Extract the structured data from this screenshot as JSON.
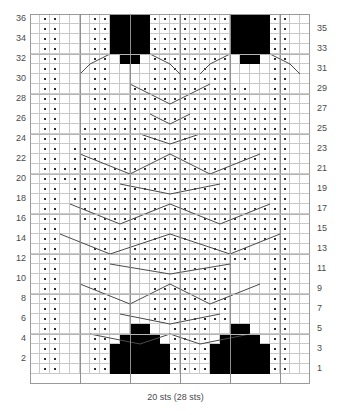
{
  "caption": "20 sts (28 sts)",
  "grid": {
    "columns": 28,
    "rows": 36,
    "cell_px": 10,
    "colors": {
      "knit_background": "#ffffff",
      "purl_dot": "#000000",
      "filled_block": "#000000",
      "grid_line": "#c9c9c9",
      "major_line": "#8f8f8f",
      "cable_line": "#4a4a4a",
      "label": "#4a4a4a"
    }
  },
  "row_labels": {
    "left": [
      36,
      34,
      32,
      30,
      28,
      26,
      24,
      22,
      20,
      18,
      16,
      14,
      12,
      10,
      8,
      6,
      4,
      2
    ],
    "right": [
      35,
      33,
      31,
      29,
      27,
      25,
      23,
      21,
      19,
      17,
      15,
      13,
      11,
      9,
      7,
      5,
      3,
      1
    ]
  },
  "chart_data": {
    "type": "heatmap",
    "title": "",
    "xlabel": "20 sts (28 sts)",
    "ylabel": "",
    "legend": [],
    "grid": true,
    "cols": 28,
    "rows": 36,
    "note": "Knitting cable chart. rows listed top (row 36) to bottom (row 1). Each row string has 28 chars: '.'=purl dot, 'K'=plain knit (empty cell), 'X'=solid black block.",
    "rows_top_to_bottom": [
      "K..KKK..XXXXXX..........XX..K",
      "K..KKK..XXXXXX..........XX..K",
      "K..KKK..XXXXXX..........XX..K",
      "K..KKK..XXXXXX..........XX..K"
    ],
    "cell_matrix_top_to_bottom": [
      [
        0,
        1,
        1,
        0,
        0,
        0,
        1,
        1,
        2,
        2,
        2,
        2,
        1,
        1,
        1,
        1,
        1,
        1,
        1,
        1,
        2,
        2,
        2,
        2,
        1,
        1,
        0,
        0
      ],
      [
        0,
        1,
        1,
        0,
        0,
        0,
        1,
        1,
        2,
        2,
        2,
        2,
        1,
        1,
        1,
        1,
        1,
        1,
        1,
        1,
        2,
        2,
        2,
        2,
        1,
        1,
        0,
        0
      ],
      [
        0,
        1,
        1,
        0,
        0,
        0,
        1,
        1,
        2,
        2,
        2,
        2,
        1,
        1,
        1,
        1,
        1,
        1,
        1,
        1,
        2,
        2,
        2,
        2,
        1,
        1,
        0,
        0
      ],
      [
        0,
        1,
        1,
        0,
        0,
        0,
        1,
        1,
        2,
        2,
        2,
        2,
        1,
        1,
        1,
        1,
        1,
        1,
        1,
        1,
        2,
        2,
        2,
        2,
        1,
        1,
        0,
        0
      ],
      [
        0,
        1,
        1,
        0,
        0,
        0,
        1,
        1,
        0,
        2,
        2,
        0,
        1,
        1,
        1,
        1,
        1,
        1,
        1,
        1,
        0,
        2,
        2,
        0,
        1,
        1,
        0,
        0
      ],
      [
        0,
        1,
        1,
        0,
        0,
        0,
        1,
        1,
        0,
        0,
        0,
        0,
        1,
        1,
        1,
        1,
        1,
        1,
        1,
        1,
        0,
        0,
        0,
        0,
        1,
        1,
        0,
        0
      ],
      [
        0,
        1,
        1,
        0,
        0,
        0,
        1,
        1,
        0,
        0,
        0,
        0,
        1,
        1,
        1,
        1,
        1,
        1,
        1,
        1,
        0,
        0,
        0,
        0,
        1,
        1,
        0,
        0
      ],
      [
        0,
        1,
        1,
        0,
        0,
        0,
        1,
        1,
        0,
        0,
        1,
        1,
        1,
        1,
        1,
        1,
        1,
        1,
        1,
        1,
        1,
        1,
        0,
        0,
        1,
        1,
        0,
        0
      ],
      [
        0,
        1,
        1,
        0,
        0,
        0,
        1,
        1,
        0,
        0,
        1,
        1,
        1,
        1,
        1,
        1,
        1,
        1,
        1,
        1,
        1,
        1,
        0,
        0,
        1,
        1,
        0,
        0
      ],
      [
        0,
        1,
        1,
        0,
        0,
        0,
        1,
        1,
        1,
        1,
        1,
        1,
        1,
        1,
        1,
        1,
        1,
        1,
        1,
        1,
        1,
        1,
        1,
        1,
        1,
        1,
        0,
        0
      ],
      [
        0,
        1,
        1,
        0,
        0,
        0,
        1,
        1,
        1,
        1,
        1,
        1,
        1,
        1,
        1,
        1,
        1,
        1,
        1,
        1,
        1,
        1,
        1,
        1,
        1,
        1,
        0,
        0
      ],
      [
        0,
        1,
        1,
        0,
        0,
        1,
        1,
        1,
        1,
        1,
        1,
        1,
        1,
        1,
        1,
        1,
        1,
        1,
        1,
        1,
        1,
        1,
        1,
        1,
        1,
        1,
        0,
        0
      ],
      [
        0,
        1,
        1,
        0,
        0,
        1,
        1,
        1,
        1,
        1,
        1,
        1,
        1,
        1,
        1,
        1,
        1,
        1,
        1,
        1,
        1,
        1,
        1,
        1,
        1,
        1,
        0,
        0
      ],
      [
        0,
        1,
        1,
        0,
        1,
        1,
        1,
        1,
        1,
        1,
        1,
        1,
        1,
        1,
        1,
        1,
        1,
        1,
        1,
        1,
        1,
        1,
        1,
        1,
        1,
        1,
        0,
        0
      ],
      [
        0,
        1,
        1,
        0,
        1,
        1,
        1,
        1,
        1,
        1,
        1,
        1,
        1,
        1,
        1,
        1,
        1,
        1,
        1,
        1,
        1,
        1,
        1,
        1,
        1,
        1,
        0,
        0
      ],
      [
        0,
        1,
        1,
        1,
        1,
        1,
        1,
        1,
        1,
        1,
        1,
        1,
        1,
        1,
        1,
        1,
        1,
        1,
        1,
        1,
        1,
        1,
        1,
        1,
        1,
        1,
        0,
        0
      ],
      [
        0,
        1,
        1,
        1,
        1,
        1,
        1,
        1,
        1,
        1,
        1,
        1,
        1,
        1,
        1,
        1,
        1,
        1,
        1,
        1,
        1,
        1,
        1,
        1,
        1,
        1,
        0,
        0
      ],
      [
        0,
        1,
        1,
        0,
        1,
        1,
        1,
        1,
        1,
        1,
        1,
        1,
        1,
        1,
        1,
        1,
        1,
        1,
        1,
        1,
        1,
        1,
        1,
        1,
        1,
        1,
        0,
        0
      ],
      [
        0,
        1,
        1,
        0,
        1,
        1,
        1,
        1,
        1,
        1,
        1,
        1,
        1,
        1,
        1,
        1,
        1,
        1,
        1,
        1,
        1,
        1,
        1,
        1,
        1,
        1,
        0,
        0
      ],
      [
        0,
        1,
        1,
        0,
        0,
        1,
        1,
        1,
        1,
        1,
        1,
        1,
        1,
        1,
        1,
        1,
        1,
        1,
        1,
        1,
        1,
        1,
        1,
        1,
        1,
        1,
        0,
        0
      ],
      [
        0,
        1,
        1,
        0,
        0,
        1,
        1,
        1,
        1,
        1,
        1,
        1,
        1,
        1,
        1,
        1,
        1,
        1,
        1,
        1,
        1,
        1,
        1,
        1,
        1,
        1,
        0,
        0
      ],
      [
        0,
        1,
        1,
        0,
        0,
        0,
        1,
        1,
        1,
        1,
        1,
        1,
        1,
        1,
        1,
        1,
        1,
        1,
        1,
        1,
        1,
        1,
        1,
        1,
        1,
        1,
        0,
        0
      ],
      [
        0,
        1,
        1,
        0,
        0,
        0,
        1,
        1,
        1,
        1,
        1,
        1,
        1,
        1,
        1,
        1,
        1,
        1,
        1,
        1,
        1,
        1,
        1,
        1,
        1,
        1,
        0,
        0
      ],
      [
        0,
        1,
        1,
        0,
        0,
        0,
        1,
        1,
        0,
        0,
        1,
        1,
        1,
        1,
        1,
        1,
        1,
        1,
        1,
        1,
        1,
        1,
        0,
        0,
        1,
        1,
        0,
        0
      ],
      [
        0,
        1,
        1,
        0,
        0,
        0,
        1,
        1,
        0,
        0,
        1,
        1,
        1,
        1,
        1,
        1,
        1,
        1,
        1,
        1,
        1,
        1,
        0,
        0,
        1,
        1,
        0,
        0
      ],
      [
        0,
        1,
        1,
        0,
        0,
        0,
        1,
        1,
        0,
        0,
        0,
        0,
        1,
        1,
        1,
        1,
        1,
        1,
        1,
        1,
        0,
        0,
        0,
        0,
        1,
        1,
        0,
        0
      ],
      [
        0,
        1,
        1,
        0,
        0,
        0,
        1,
        1,
        0,
        0,
        0,
        0,
        1,
        1,
        1,
        1,
        1,
        1,
        1,
        1,
        0,
        0,
        0,
        0,
        1,
        1,
        0,
        0
      ],
      [
        0,
        1,
        1,
        0,
        0,
        0,
        1,
        1,
        0,
        0,
        0,
        0,
        1,
        1,
        1,
        1,
        1,
        1,
        1,
        1,
        0,
        0,
        0,
        0,
        1,
        1,
        0,
        0
      ],
      [
        0,
        1,
        1,
        0,
        0,
        0,
        1,
        1,
        0,
        0,
        0,
        0,
        1,
        1,
        1,
        1,
        1,
        1,
        1,
        1,
        0,
        0,
        0,
        0,
        1,
        1,
        0,
        0
      ],
      [
        0,
        1,
        1,
        0,
        0,
        0,
        1,
        1,
        0,
        0,
        0,
        0,
        1,
        1,
        1,
        1,
        1,
        1,
        1,
        1,
        0,
        0,
        0,
        0,
        1,
        1,
        0,
        0
      ],
      [
        0,
        1,
        1,
        0,
        0,
        0,
        1,
        1,
        0,
        0,
        0,
        0,
        1,
        1,
        1,
        1,
        1,
        1,
        1,
        1,
        0,
        0,
        0,
        0,
        1,
        1,
        0,
        0
      ],
      [
        0,
        1,
        1,
        0,
        0,
        0,
        1,
        1,
        0,
        0,
        2,
        2,
        0,
        0,
        1,
        1,
        1,
        1,
        0,
        0,
        2,
        2,
        0,
        0,
        1,
        1,
        0,
        0
      ],
      [
        0,
        1,
        1,
        0,
        0,
        0,
        1,
        1,
        0,
        2,
        2,
        2,
        2,
        0,
        1,
        1,
        1,
        1,
        0,
        2,
        2,
        2,
        2,
        0,
        1,
        1,
        0,
        0
      ],
      [
        0,
        1,
        1,
        0,
        0,
        0,
        1,
        1,
        2,
        2,
        2,
        2,
        2,
        2,
        1,
        1,
        1,
        1,
        2,
        2,
        2,
        2,
        2,
        2,
        1,
        1,
        0,
        0
      ],
      [
        0,
        1,
        1,
        0,
        0,
        0,
        1,
        1,
        2,
        2,
        2,
        2,
        2,
        2,
        1,
        1,
        1,
        1,
        2,
        2,
        2,
        2,
        2,
        2,
        1,
        1,
        0,
        0
      ],
      [
        0,
        1,
        1,
        0,
        0,
        0,
        1,
        1,
        2,
        2,
        2,
        2,
        2,
        2,
        1,
        1,
        1,
        1,
        2,
        2,
        2,
        2,
        2,
        2,
        1,
        1,
        0,
        0
      ]
    ],
    "cable_lines_grid_coords": [
      [
        8,
        4,
        6,
        5
      ],
      [
        6,
        5,
        5,
        6
      ],
      [
        12,
        4,
        14,
        5
      ],
      [
        14,
        5,
        15,
        6
      ],
      [
        20,
        4,
        18,
        5
      ],
      [
        18,
        5,
        17,
        6
      ],
      [
        24,
        4,
        26,
        5
      ],
      [
        26,
        5,
        27,
        6
      ],
      [
        10,
        7,
        14,
        9
      ],
      [
        14,
        9,
        18,
        7
      ],
      [
        12,
        10,
        14,
        11
      ],
      [
        14,
        11,
        16,
        10
      ],
      [
        11,
        12,
        14,
        13
      ],
      [
        14,
        13,
        17,
        12
      ],
      [
        5,
        14,
        10,
        16
      ],
      [
        10,
        16,
        14,
        14
      ],
      [
        14,
        14,
        18,
        16
      ],
      [
        18,
        16,
        23,
        14
      ],
      [
        9,
        17,
        14,
        18
      ],
      [
        14,
        18,
        19,
        17
      ],
      [
        4,
        19,
        9,
        21
      ],
      [
        9,
        21,
        14,
        19
      ],
      [
        14,
        19,
        19,
        21
      ],
      [
        19,
        21,
        24,
        19
      ],
      [
        3,
        22,
        8,
        24
      ],
      [
        8,
        24,
        14,
        22
      ],
      [
        14,
        22,
        20,
        24
      ],
      [
        20,
        24,
        25,
        22
      ],
      [
        8,
        25,
        14,
        26
      ],
      [
        14,
        26,
        20,
        25
      ],
      [
        5,
        27,
        10,
        29
      ],
      [
        10,
        29,
        14,
        27
      ],
      [
        14,
        27,
        18,
        29
      ],
      [
        18,
        29,
        23,
        27
      ],
      [
        9,
        30,
        14,
        31
      ],
      [
        14,
        31,
        19,
        30
      ],
      [
        6,
        32,
        11,
        33
      ],
      [
        11,
        33,
        14,
        32
      ],
      [
        14,
        32,
        17,
        33
      ],
      [
        17,
        33,
        22,
        32
      ]
    ]
  }
}
